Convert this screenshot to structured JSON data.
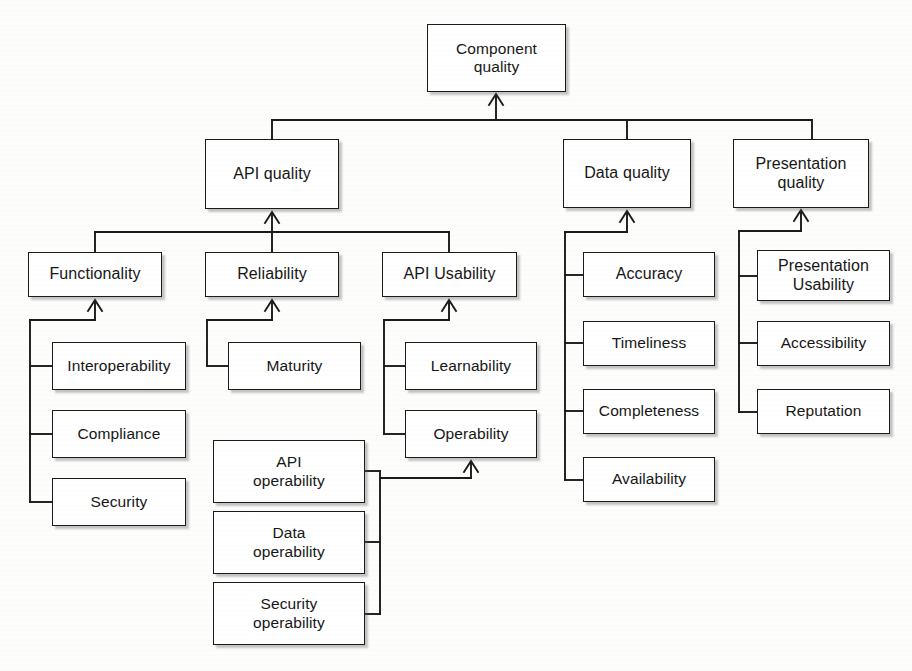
{
  "diagram": {
    "type": "hierarchy-tree",
    "title": "Component quality",
    "root": {
      "label": "Component\nquality"
    },
    "nodes": [
      {
        "id": "component-quality",
        "label": "Component\nquality",
        "level": 0,
        "x": 427,
        "y": 24,
        "w": 139,
        "h": 68
      },
      {
        "id": "api-quality",
        "label": "API quality",
        "level": 1,
        "x": 205,
        "y": 139,
        "w": 134,
        "h": 70
      },
      {
        "id": "data-quality",
        "label": "Data quality",
        "level": 1,
        "x": 563,
        "y": 139,
        "w": 128,
        "h": 69
      },
      {
        "id": "presentation-quality",
        "label": "Presentation\nquality",
        "level": 1,
        "x": 733,
        "y": 139,
        "w": 136,
        "h": 69
      },
      {
        "id": "functionality",
        "label": "Functionality",
        "level": 2,
        "x": 28,
        "y": 252,
        "w": 134,
        "h": 45
      },
      {
        "id": "reliability",
        "label": "Reliability",
        "level": 2,
        "x": 205,
        "y": 252,
        "w": 134,
        "h": 45
      },
      {
        "id": "api-usability",
        "label": "API Usability",
        "level": 2,
        "x": 382,
        "y": 252,
        "w": 135,
        "h": 45
      },
      {
        "id": "accuracy",
        "label": "Accuracy",
        "level": 2,
        "x": 583,
        "y": 252,
        "w": 132,
        "h": 45
      },
      {
        "id": "presentation-usability",
        "label": "Presentation\nUsability",
        "level": 2,
        "x": 757,
        "y": 250,
        "w": 133,
        "h": 51
      },
      {
        "id": "interoperability",
        "label": "Interoperability",
        "level": 3,
        "x": 52,
        "y": 342,
        "w": 134,
        "h": 48
      },
      {
        "id": "maturity",
        "label": "Maturity",
        "level": 3,
        "x": 228,
        "y": 342,
        "w": 133,
        "h": 48
      },
      {
        "id": "learnability",
        "label": "Learnability",
        "level": 3,
        "x": 405,
        "y": 342,
        "w": 132,
        "h": 48
      },
      {
        "id": "timeliness",
        "label": "Timeliness",
        "level": 3,
        "x": 583,
        "y": 321,
        "w": 132,
        "h": 45
      },
      {
        "id": "accessibility",
        "label": "Accessibility",
        "level": 3,
        "x": 757,
        "y": 321,
        "w": 133,
        "h": 45
      },
      {
        "id": "compliance",
        "label": "Compliance",
        "level": 3,
        "x": 52,
        "y": 410,
        "w": 134,
        "h": 48
      },
      {
        "id": "operability",
        "label": "Operability",
        "level": 3,
        "x": 405,
        "y": 410,
        "w": 132,
        "h": 48
      },
      {
        "id": "completeness",
        "label": "Completeness",
        "level": 3,
        "x": 583,
        "y": 389,
        "w": 132,
        "h": 45
      },
      {
        "id": "reputation",
        "label": "Reputation",
        "level": 3,
        "x": 757,
        "y": 389,
        "w": 133,
        "h": 45
      },
      {
        "id": "security",
        "label": "Security",
        "level": 3,
        "x": 52,
        "y": 478,
        "w": 134,
        "h": 48
      },
      {
        "id": "availability",
        "label": "Availability",
        "level": 3,
        "x": 583,
        "y": 457,
        "w": 132,
        "h": 45
      },
      {
        "id": "api-operability",
        "label": "API\noperability",
        "level": 4,
        "x": 213,
        "y": 440,
        "w": 152,
        "h": 63
      },
      {
        "id": "data-operability",
        "label": "Data\noperability",
        "level": 4,
        "x": 213,
        "y": 511,
        "w": 152,
        "h": 63
      },
      {
        "id": "security-operability",
        "label": "Security\noperability",
        "level": 4,
        "x": 213,
        "y": 582,
        "w": 152,
        "h": 63
      }
    ],
    "edges": [
      {
        "from": "api-quality",
        "to": "component-quality",
        "style": "arrow"
      },
      {
        "from": "data-quality",
        "to": "component-quality",
        "style": "arrow"
      },
      {
        "from": "presentation-quality",
        "to": "component-quality",
        "style": "arrow"
      },
      {
        "from": "functionality",
        "to": "api-quality",
        "style": "arrow"
      },
      {
        "from": "reliability",
        "to": "api-quality",
        "style": "arrow"
      },
      {
        "from": "api-usability",
        "to": "api-quality",
        "style": "arrow"
      },
      {
        "from": "interoperability",
        "to": "functionality",
        "style": "arrow"
      },
      {
        "from": "compliance",
        "to": "functionality",
        "style": "arrow"
      },
      {
        "from": "security",
        "to": "functionality",
        "style": "arrow"
      },
      {
        "from": "maturity",
        "to": "reliability",
        "style": "arrow"
      },
      {
        "from": "learnability",
        "to": "api-usability",
        "style": "arrow"
      },
      {
        "from": "operability",
        "to": "api-usability",
        "style": "arrow"
      },
      {
        "from": "accuracy",
        "to": "data-quality",
        "style": "arrow"
      },
      {
        "from": "timeliness",
        "to": "data-quality",
        "style": "arrow"
      },
      {
        "from": "completeness",
        "to": "data-quality",
        "style": "arrow"
      },
      {
        "from": "availability",
        "to": "data-quality",
        "style": "arrow"
      },
      {
        "from": "presentation-usability",
        "to": "presentation-quality",
        "style": "arrow"
      },
      {
        "from": "accessibility",
        "to": "presentation-quality",
        "style": "arrow"
      },
      {
        "from": "reputation",
        "to": "presentation-quality",
        "style": "arrow"
      },
      {
        "from": "api-operability",
        "to": "operability",
        "style": "arrow"
      },
      {
        "from": "data-operability",
        "to": "operability",
        "style": "arrow"
      },
      {
        "from": "security-operability",
        "to": "operability",
        "style": "arrow"
      }
    ],
    "colors": {
      "line": "#1a1a1a",
      "box_fill": "#ffffff",
      "box_border": "#1a1a1a",
      "text": "#161616",
      "background": "#fdfdfb"
    }
  }
}
